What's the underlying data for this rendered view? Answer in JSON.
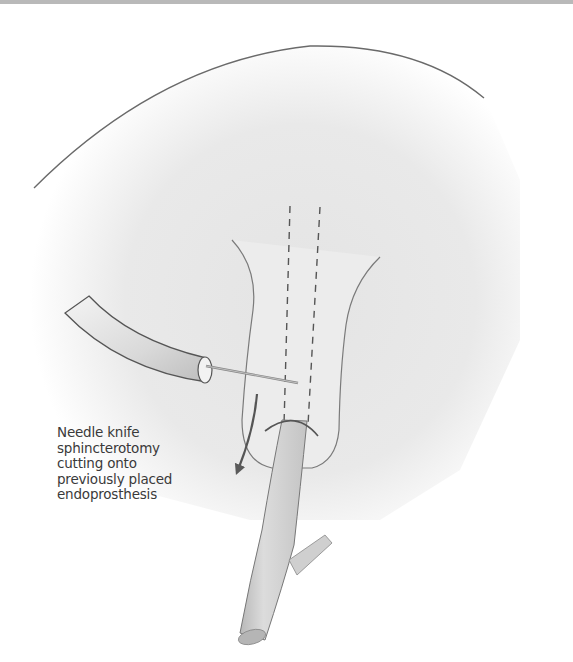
{
  "figure": {
    "annotation_lines": [
      "Needle knife",
      "sphincterotomy",
      "cutting onto",
      "previously placed",
      "endoprosthesis"
    ]
  },
  "colors": {
    "line": "#6a6a6a",
    "shade": "#e6e6e6",
    "text": "#3a3a3a",
    "topbar": "#b9b9b9"
  }
}
